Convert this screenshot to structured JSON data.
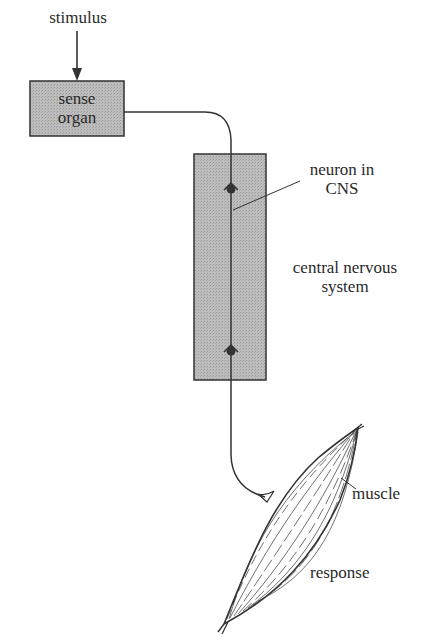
{
  "diagram": {
    "labels": {
      "stimulus": "stimulus",
      "sense_organ_line1": "sense",
      "sense_organ_line2": "organ",
      "neuron_line1": "neuron in",
      "neuron_line2": "CNS",
      "cns_line1": "central nervous",
      "cns_line2": "system",
      "muscle": "muscle",
      "response": "response"
    },
    "nodes": [
      {
        "id": "stimulus",
        "type": "text"
      },
      {
        "id": "sense-organ",
        "type": "box"
      },
      {
        "id": "central-nervous-system",
        "type": "box"
      },
      {
        "id": "muscle",
        "type": "shape"
      }
    ],
    "edges": [
      {
        "from": "stimulus",
        "to": "sense-organ",
        "style": "arrow"
      },
      {
        "from": "sense-organ",
        "to": "central-nervous-system",
        "style": "nerve"
      },
      {
        "from": "central-nervous-system",
        "to": "muscle",
        "style": "nerve"
      }
    ],
    "colors": {
      "box_fill": "#b5b5b5",
      "stroke": "#333333",
      "background": "#ffffff"
    }
  }
}
